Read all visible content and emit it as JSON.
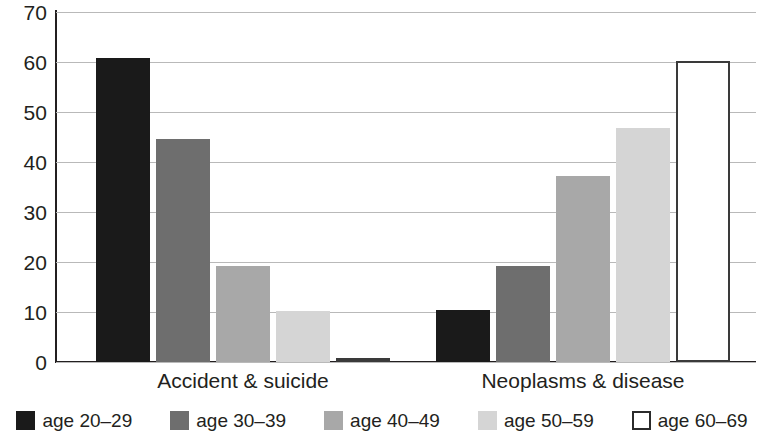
{
  "chart_data": {
    "type": "bar",
    "title": "",
    "subtitle": "",
    "xlabel": "",
    "ylabel": "",
    "categories": [
      "Accident & suicide",
      "Neoplasms & disease"
    ],
    "series": [
      {
        "name": "age 20–29",
        "color": "#1a1a1a",
        "swatch": "swatch-black",
        "values": [
          60.8,
          10.5
        ]
      },
      {
        "name": "age 30–39",
        "color": "#6e6e6e",
        "swatch": "swatch-dgray",
        "values": [
          44.7,
          19.3
        ]
      },
      {
        "name": "age 40–49",
        "color": "#a8a8a8",
        "swatch": "swatch-mgray",
        "values": [
          19.3,
          37.2
        ]
      },
      {
        "name": "age 50–59",
        "color": "#d5d5d5",
        "swatch": "swatch-lgray",
        "values": [
          10.3,
          46.8
        ]
      },
      {
        "name": "age 60–69",
        "color": "#ffffff",
        "swatch": "swatch-white",
        "values": [
          0.8,
          60.2
        ]
      }
    ],
    "ylim": [
      0,
      70
    ],
    "yticks": [
      0,
      10,
      20,
      30,
      40,
      50,
      60,
      70
    ],
    "ytick_labels": [
      "0",
      "10",
      "20",
      "30",
      "40",
      "50",
      "60",
      "70"
    ],
    "grid": true,
    "grid_axis": "y",
    "legend_position": "bottom-center",
    "legend_entries": [
      "age 20–29",
      "age 30–39",
      "age 40–49",
      "age 50–59",
      "age 60–69"
    ],
    "annotations": []
  },
  "axis": {
    "y_line_color": "#231f20",
    "x_line_color": "#231f20",
    "gridline_color": "#b9b9b9"
  }
}
